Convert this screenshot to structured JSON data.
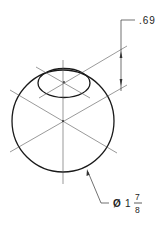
{
  "drawing": {
    "type": "isometric sphere with spot face / counterbore",
    "colors": {
      "background": "#ffffff",
      "outline": "#1a1a1a",
      "centerline": "#555555",
      "dimension": "#333333"
    },
    "sphere": {
      "cx": 63,
      "cy": 121,
      "r": 51
    },
    "top_ellipse": {
      "cx": 64,
      "cy": 83,
      "rx": 26,
      "ry": 14.5
    }
  },
  "dimensions": {
    "depth": {
      "label": ".69"
    },
    "diameter": {
      "symbol": "Ø",
      "whole": "1",
      "numerator": "7",
      "denominator": "8"
    }
  }
}
